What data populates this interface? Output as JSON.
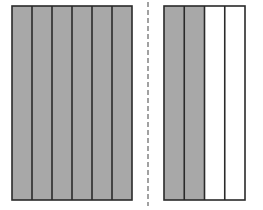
{
  "diagram": {
    "colors": {
      "shaded": "#a8a8a8",
      "unshaded": "#ffffff",
      "stroke": "#2a2a2a",
      "divider": "#8a8a8a"
    },
    "left_model": {
      "parts": 6,
      "shaded": 6,
      "x": 12,
      "y": 6,
      "width": 120,
      "height": 194
    },
    "divider": {
      "x": 148,
      "style": "dashed"
    },
    "right_model": {
      "parts": 4,
      "shaded": 2,
      "x": 164,
      "y": 6,
      "width": 81,
      "height": 194
    }
  }
}
